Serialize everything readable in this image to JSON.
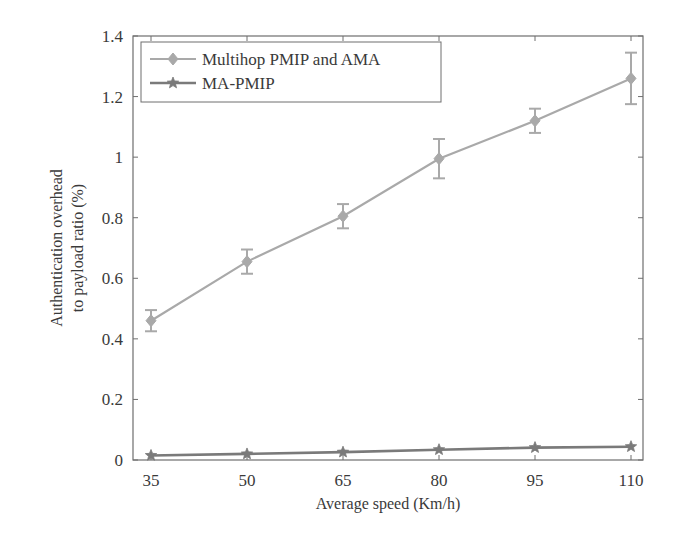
{
  "chart_data": {
    "type": "line",
    "title": "",
    "xlabel": "Average speed (Km/h)",
    "ylabel_lines": [
      "Authentication overhead",
      "to payload ratio (%)"
    ],
    "ylabel": "Authentication overhead to payload ratio (%)",
    "categories": [
      "35",
      "50",
      "65",
      "80",
      "95",
      "110"
    ],
    "x": [
      35,
      50,
      65,
      80,
      95,
      110
    ],
    "ylim": [
      0,
      1.4
    ],
    "yticks": [
      0,
      0.2,
      0.4,
      0.6,
      0.8,
      1,
      1.2,
      1.4
    ],
    "ytick_labels": [
      "0",
      "0.2",
      "0.4",
      "0.6",
      "0.8",
      "1",
      "1.2",
      "1.4"
    ],
    "grid": false,
    "legend_position": "upper left",
    "series": [
      {
        "name": "Multihop PMIP and AMA",
        "marker": "diamond",
        "color": "#a9a9a9",
        "values": [
          0.46,
          0.655,
          0.805,
          0.995,
          1.12,
          1.26
        ],
        "error": [
          0.035,
          0.04,
          0.04,
          0.065,
          0.04,
          0.085
        ]
      },
      {
        "name": "MA-PMIP",
        "marker": "star",
        "color": "#7a7a7a",
        "values": [
          0.015,
          0.02,
          0.026,
          0.034,
          0.041,
          0.044
        ],
        "error": [
          0,
          0,
          0,
          0,
          0,
          0
        ]
      }
    ]
  },
  "legend": {
    "items": [
      {
        "label": "Multihop PMIP and AMA"
      },
      {
        "label": "MA-PMIP"
      }
    ]
  },
  "axes": {
    "x_title": "Average speed (Km/h)",
    "y_title_line1": "Authentication overhead",
    "y_title_line2": "to payload ratio (%)"
  }
}
